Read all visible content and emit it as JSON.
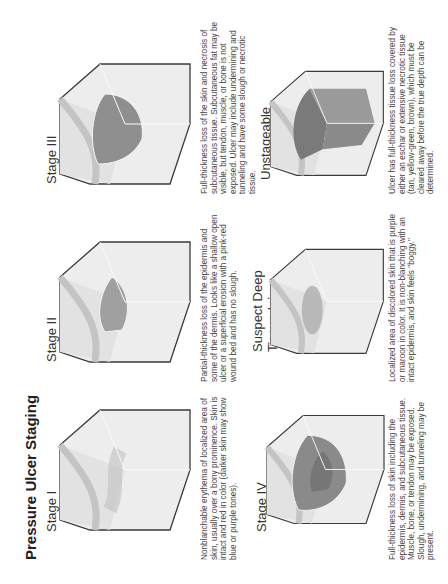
{
  "title": "Pressure Ulcer Staging",
  "stages": [
    {
      "label": "Stage I",
      "description": "Nonblanchable erythema of localized area of skin, usually over a bony prominence. Skin is intact and red in color (darker skin may show blue or purple tones)."
    },
    {
      "label": "Stage II",
      "description": "Partial-thickness loss of the epidermis and some of the dermis. Looks like a shallow open ulcer or a superficial erosion with a pink-red wound bed and has no slough."
    },
    {
      "label": "Stage III",
      "description": "Full-thickness loss of the skin and necrosis of subcutaneous tissue. Subcutaneous fat may be visible, but tendon, muscle, or bone is not exposed. Ulcer may include undermining and tunneling and have some slough or necrotic tissue."
    },
    {
      "label": "Stage IV",
      "description": "Full-thickness loss of skin including the epidermis, dermis, and subcutaneous tissue. Muscle, bone, or tendon may be exposed. Slough, undermining, and tunneling may be present."
    },
    {
      "label_line1": "Suspect Deep",
      "label_line2": "Tissue Injury",
      "description": "Localized area of discolored skin that is purple or maroon in color. It is non-blanching with an intact epidermis, and skin feels \"boggy.\""
    },
    {
      "label": "Unstageable",
      "description": "Ulcer has full-thickness tissue loss covered by either an eschar or extensive necrotic tissue (tan, yellow-green, brown), which must be cleared away before the true depth can be determined."
    }
  ],
  "colors": {
    "outline": "#3a3a3a",
    "skin_surface": "#e6e6e6",
    "skin_side": "#efefef",
    "dermis_band": "#bdbdbd",
    "wound_light": "#a8a8a8",
    "wound_dark": "#7d7d7d",
    "text": "#444444"
  }
}
